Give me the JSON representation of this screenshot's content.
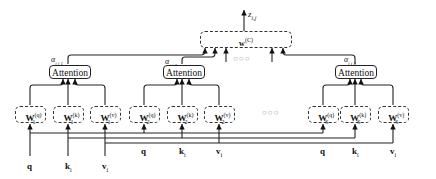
{
  "diagram": {
    "output": {
      "label": "z",
      "sub": "i,j",
      "box_label": "w",
      "box_sup": "(C)"
    },
    "ellipsis": "○○○",
    "heads": [
      {
        "id": 1,
        "attention_label": "Attention",
        "alpha": "α",
        "alpha_sub": "i,j,1",
        "weights": [
          {
            "base": "W",
            "sub": "1",
            "sup": "(q)"
          },
          {
            "base": "W",
            "sub": "1",
            "sup": "(k)"
          },
          {
            "base": "W",
            "sub": "1",
            "sup": "(v)"
          }
        ]
      },
      {
        "id": 2,
        "attention_label": "Attention",
        "alpha": "α",
        "alpha_sub": "i,j,2",
        "weights": [
          {
            "base": "W",
            "sub": "2",
            "sup": "(q)"
          },
          {
            "base": "W",
            "sub": "2",
            "sup": "(k)"
          },
          {
            "base": "W",
            "sub": "2",
            "sup": "(v)"
          }
        ]
      },
      {
        "id": "S",
        "attention_label": "Attention",
        "alpha": "α",
        "alpha_sub": "i,j,S",
        "weights": [
          {
            "base": "W",
            "sub": "S",
            "sup": "(q)"
          },
          {
            "base": "W",
            "sub": "S",
            "sup": "(k)"
          },
          {
            "base": "W",
            "sub": "S",
            "sup": "(v)"
          }
        ]
      }
    ],
    "inputs": [
      {
        "base": "q",
        "sub": ""
      },
      {
        "base": "k",
        "sub": "i"
      },
      {
        "base": "v",
        "sub": "i"
      }
    ]
  }
}
